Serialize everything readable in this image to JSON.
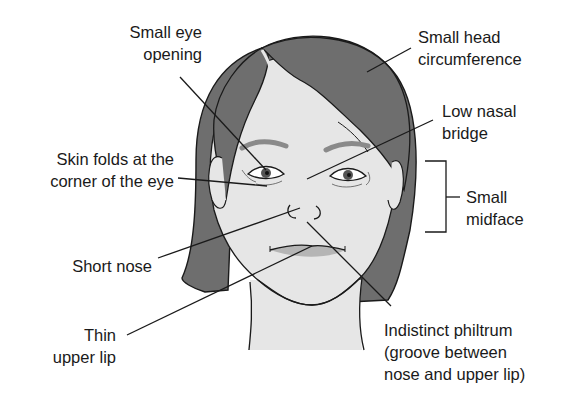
{
  "diagram": {
    "colors": {
      "hair": "#6e6e6e",
      "skin": "#e6e6e6",
      "lip": "#b5b5b5",
      "brow": "#8a8a8a",
      "outline": "#1a1a1a",
      "text": "#1a1a1a",
      "background": "#ffffff"
    },
    "labels": {
      "small_eye_opening": {
        "line1": "Small eye",
        "line2": "opening"
      },
      "skin_folds": {
        "line1": "Skin folds at the",
        "line2": "corner of the eye"
      },
      "short_nose": {
        "line1": "Short nose"
      },
      "thin_upper_lip": {
        "line1": "Thin",
        "line2": "upper lip"
      },
      "small_head_circumference": {
        "line1": "Small head",
        "line2": "circumference"
      },
      "low_nasal_bridge": {
        "line1": "Low nasal",
        "line2": "bridge"
      },
      "small_midface": {
        "line1": "Small",
        "line2": "midface"
      },
      "indistinct_philtrum": {
        "line1": "Indistinct philtrum",
        "line2": "(groove between",
        "line3": "nose and upper lip)"
      }
    }
  }
}
